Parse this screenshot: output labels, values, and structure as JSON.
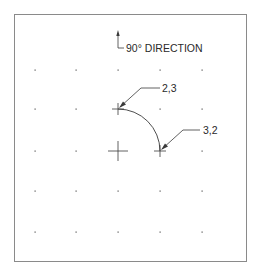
{
  "diagram": {
    "direction_label": "90° DIRECTION",
    "points": [
      {
        "label": "2,3",
        "x": 118,
        "y": 109
      },
      {
        "label": "3,2",
        "x": 160,
        "y": 151
      }
    ],
    "center": {
      "x": 118,
      "y": 151
    },
    "arc_radius": 42,
    "grid": {
      "xs": [
        35,
        76,
        118,
        160,
        202
      ],
      "ys": [
        70,
        109,
        151,
        191,
        232
      ]
    },
    "colors": {
      "line": "#3a3a3a",
      "frame": "#8a8a8a",
      "dot": "#555555"
    }
  }
}
